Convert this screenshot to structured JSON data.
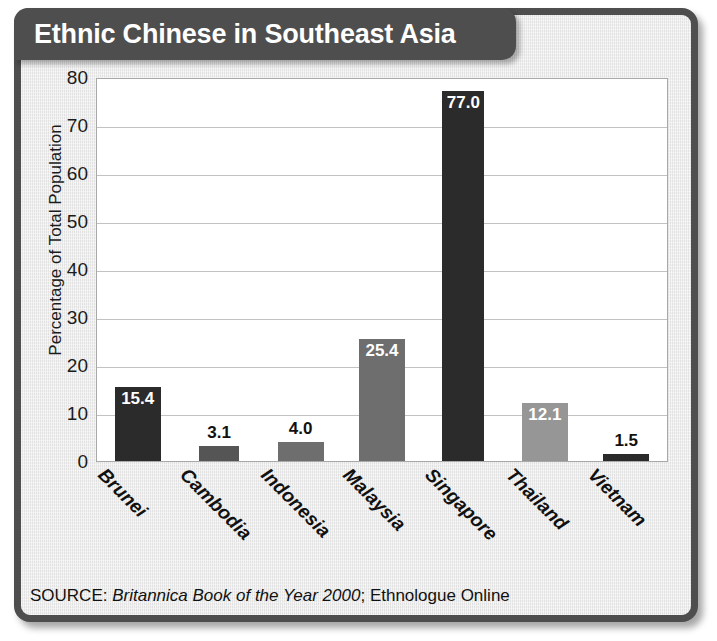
{
  "title": "Ethnic Chinese in Southeast Asia",
  "source": {
    "prefix": "SOURCE: ",
    "italic": "Britannica Book of the Year 2000",
    "suffix": "; Ethnologue Online"
  },
  "colors": {
    "frame": "#4e4e4e",
    "panel": "#ebebeb",
    "plot_background": "#ffffff",
    "gridline": "#c2c2c2",
    "bar_dark": "#2b2b2b",
    "bar_mid_dark": "#555555",
    "bar_mid": "#6e6e6e",
    "bar_light": "#969696",
    "label_light": "#ffffff",
    "label_dark": "#111111"
  },
  "chart_data": {
    "type": "bar",
    "title": "Ethnic Chinese in Southeast Asia",
    "xlabel": "",
    "ylabel": "Percentage of Total Population",
    "ylim": [
      0,
      80
    ],
    "yticks": [
      0,
      10,
      20,
      30,
      40,
      50,
      60,
      70,
      80
    ],
    "grid": true,
    "legend": false,
    "categories": [
      "Brunei",
      "Cambodia",
      "Indonesia",
      "Malaysia",
      "Singapore",
      "Thailand",
      "Vietnam"
    ],
    "values": [
      15.4,
      3.1,
      4.0,
      25.4,
      77.0,
      12.1,
      1.5
    ],
    "value_labels": [
      "15.4",
      "3.1",
      "4.0",
      "25.4",
      "77.0",
      "12.1",
      "1.5"
    ],
    "bar_colors": [
      "#2b2b2b",
      "#555555",
      "#6e6e6e",
      "#6e6e6e",
      "#2b2b2b",
      "#969696",
      "#2b2b2b"
    ],
    "label_placement": [
      "inside",
      "above",
      "above",
      "inside",
      "inside",
      "inside",
      "above"
    ],
    "bar_widths": [
      46,
      40,
      46,
      46,
      42,
      46,
      46
    ]
  }
}
